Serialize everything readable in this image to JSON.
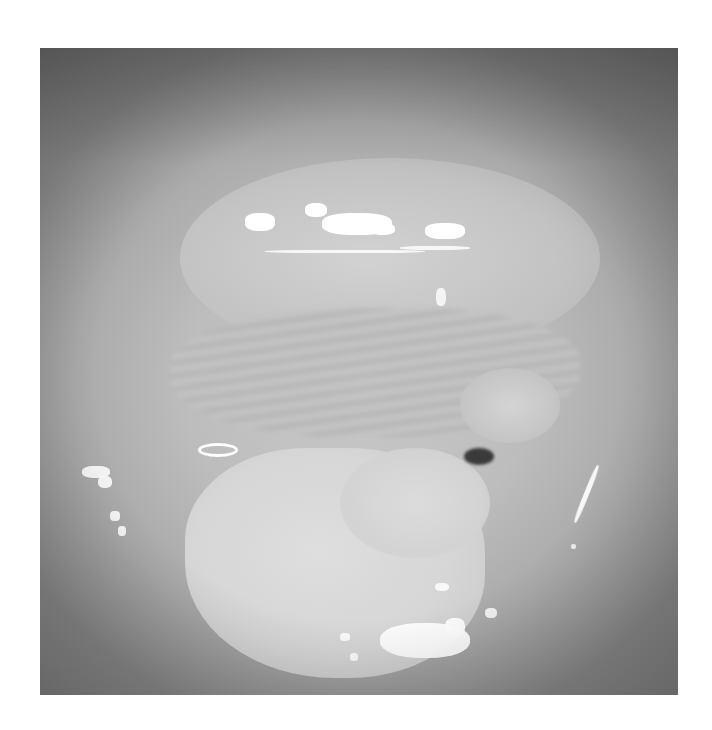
{
  "image": {
    "description": "Grayscale endoscopic/colposcopic photograph of tissue with a central lesion and specular highlights",
    "colors": {
      "background": "#ffffff",
      "tissue_light": "#d6d6d6",
      "tissue_mid": "#bdbdbd",
      "tissue_dark_edge": "#8c8c8c",
      "dark_spot": "#3a3a3a",
      "highlight": "#ffffff"
    }
  }
}
